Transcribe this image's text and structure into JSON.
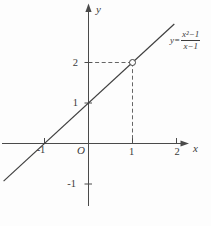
{
  "figure": {
    "background": "#fdfdfd",
    "ink_color": "#3f3f3f"
  },
  "axes": {
    "x_label": "x",
    "y_label": "y",
    "origin_label": "O",
    "x_tick_labels": [
      "-1",
      "1",
      "2"
    ],
    "y_tick_labels": [
      "2",
      "1",
      "-1"
    ]
  },
  "formula": {
    "lhs": "y=",
    "numerator": "x²−1",
    "denominator": "x−1"
  },
  "chart_data": {
    "type": "line",
    "title": "",
    "function": "y = (x²−1)/(x−1)",
    "simplified": "y = x + 1 with a hole (undefined point) at x = 1",
    "x_range": [
      -2,
      2.2
    ],
    "y_range": [
      -1.6,
      3.4
    ],
    "x_ticks": [
      -1,
      1,
      2
    ],
    "y_ticks": [
      2,
      1,
      -1
    ],
    "line_points": [
      [
        -1.93,
        -0.93
      ],
      [
        1.95,
        2.95
      ]
    ],
    "hole_point": [
      1,
      2
    ],
    "x_intercept": [
      -1,
      0
    ],
    "y_intercept": [
      0,
      1
    ],
    "dashed_guides": [
      [
        [
          0,
          2
        ],
        [
          1,
          2
        ]
      ],
      [
        [
          1,
          2
        ],
        [
          1,
          0
        ]
      ]
    ],
    "grid": false,
    "legend": "none"
  }
}
